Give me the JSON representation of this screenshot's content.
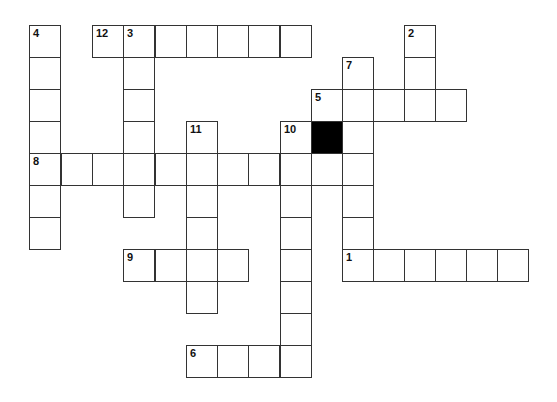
{
  "puzzle": {
    "colors": {
      "border": "#333333",
      "fill": "#ffffff",
      "block": "#000000"
    },
    "geometry": {
      "col_x": [
        29,
        61,
        92,
        123,
        155,
        186,
        217,
        248,
        280,
        311,
        342,
        373,
        404,
        435,
        466,
        497
      ],
      "row_y": [
        25,
        57,
        89,
        121,
        153,
        185,
        217,
        249,
        281,
        313,
        345
      ]
    },
    "entries": [
      {
        "number": "1",
        "direction": "across",
        "row": 7,
        "col": 10,
        "length": 6
      },
      {
        "number": "2",
        "direction": "down",
        "row": 0,
        "col": 12,
        "length": 3
      },
      {
        "number": "3",
        "direction": "down",
        "row": 0,
        "col": 3,
        "length": 6
      },
      {
        "number": "4",
        "direction": "down",
        "row": 0,
        "col": 0,
        "length": 7
      },
      {
        "number": "5",
        "direction": "across",
        "row": 2,
        "col": 9,
        "length": 5
      },
      {
        "number": "6",
        "direction": "across",
        "row": 10,
        "col": 5,
        "length": 4
      },
      {
        "number": "7",
        "direction": "down",
        "row": 1,
        "col": 10,
        "length": 7
      },
      {
        "number": "8",
        "direction": "across",
        "row": 4,
        "col": 0,
        "length": 11
      },
      {
        "number": "9",
        "direction": "across",
        "row": 7,
        "col": 3,
        "length": 4
      },
      {
        "number": "10",
        "direction": "down",
        "row": 3,
        "col": 8,
        "length": 8
      },
      {
        "number": "11",
        "direction": "down",
        "row": 3,
        "col": 5,
        "length": 6
      },
      {
        "number": "12",
        "direction": "across",
        "row": 0,
        "col": 2,
        "length": 7
      }
    ],
    "black_cells": [
      {
        "row": 3,
        "col": 9
      }
    ]
  }
}
